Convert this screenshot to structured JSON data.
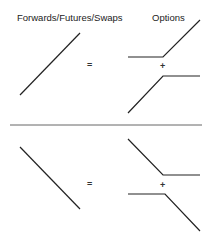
{
  "headers": {
    "left": "Forwards/Futures/Swaps",
    "right": "Options"
  },
  "symbols": {
    "equals": "=",
    "plus": "+"
  },
  "colors": {
    "line": "#222222",
    "divider": "#666666",
    "background": "#ffffff"
  },
  "rows": [
    {
      "name": "long-forward",
      "forward": [
        [
          20,
          95
        ],
        [
          80,
          33
        ]
      ],
      "option_top": [
        [
          128,
          57
        ],
        [
          163,
          57
        ],
        [
          200,
          20
        ]
      ],
      "option_bottom": [
        [
          128,
          113
        ],
        [
          163,
          76
        ],
        [
          200,
          76
        ]
      ]
    },
    {
      "name": "short-forward",
      "forward": [
        [
          20,
          147
        ],
        [
          80,
          209
        ]
      ],
      "option_top": [
        [
          128,
          139
        ],
        [
          163,
          175
        ],
        [
          200,
          175
        ]
      ],
      "option_bottom": [
        [
          128,
          194
        ],
        [
          165,
          194
        ],
        [
          200,
          231
        ]
      ]
    }
  ]
}
